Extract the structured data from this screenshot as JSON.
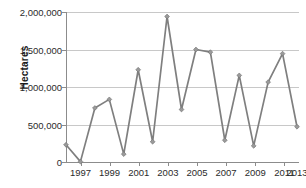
{
  "chart_data": {
    "type": "line",
    "title": "",
    "xlabel": "",
    "ylabel": "Hectares",
    "x": [
      1997,
      1998,
      1999,
      2000,
      2001,
      2002,
      2003,
      2004,
      2005,
      2006,
      2007,
      2008,
      2009,
      2010,
      2011,
      2012,
      2013
    ],
    "values": [
      230000,
      5000,
      720000,
      835000,
      105000,
      1230000,
      270000,
      1940000,
      700000,
      1500000,
      1465000,
      290000,
      1155000,
      215000,
      1065000,
      1445000,
      470000
    ],
    "series": [
      {
        "name": "Hectares",
        "values": [
          230000,
          5000,
          720000,
          835000,
          105000,
          1230000,
          270000,
          1940000,
          700000,
          1500000,
          1465000,
          290000,
          1155000,
          215000,
          1065000,
          1445000,
          470000
        ],
        "color": "#7f7f7f",
        "marker": "diamond"
      }
    ],
    "ylim": [
      0,
      2000000
    ],
    "xlim": [
      1997,
      2013
    ],
    "ytick_labels": [
      "0",
      "500,000",
      "1,000,000",
      "1,500,000",
      "2,000,000"
    ],
    "ytick_values": [
      0,
      500000,
      1000000,
      1500000,
      2000000
    ],
    "xtick_labels": [
      "1997",
      "1999",
      "2001",
      "2003",
      "2005",
      "2007",
      "2009",
      "2011",
      "2013"
    ],
    "xtick_values": [
      1997,
      1999,
      2001,
      2003,
      2005,
      2007,
      2009,
      2011,
      2013
    ],
    "grid": "horizontal",
    "legend": "none",
    "colors": {
      "line": "#7f7f7f",
      "marker": "#9a9a9a",
      "grid": "#c8c8c8",
      "axis": "#8c8c8c",
      "text": "#2b2b2b",
      "background": "#ffffff"
    }
  }
}
